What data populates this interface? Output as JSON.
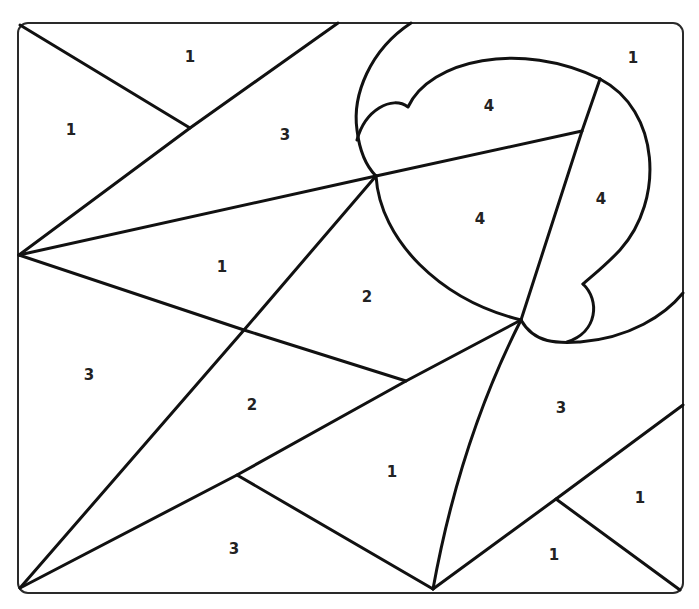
{
  "puzzle": {
    "type": "color-by-number",
    "colors": {
      "line": "#111111",
      "frame": "#2a2a2a",
      "background": "#ffffff"
    },
    "regions": [
      {
        "id": "r01",
        "number": "1",
        "x": 190,
        "y": 57
      },
      {
        "id": "r02",
        "number": "1",
        "x": 71,
        "y": 130
      },
      {
        "id": "r03",
        "number": "3",
        "x": 285,
        "y": 135
      },
      {
        "id": "r04",
        "number": "4",
        "x": 489,
        "y": 106
      },
      {
        "id": "r05",
        "number": "1",
        "x": 633,
        "y": 58
      },
      {
        "id": "r06",
        "number": "4",
        "x": 601,
        "y": 199
      },
      {
        "id": "r07",
        "number": "4",
        "x": 480,
        "y": 219
      },
      {
        "id": "r08",
        "number": "1",
        "x": 222,
        "y": 267
      },
      {
        "id": "r09",
        "number": "2",
        "x": 367,
        "y": 297
      },
      {
        "id": "r10",
        "number": "3",
        "x": 89,
        "y": 375
      },
      {
        "id": "r11",
        "number": "2",
        "x": 252,
        "y": 405
      },
      {
        "id": "r12",
        "number": "3",
        "x": 561,
        "y": 408
      },
      {
        "id": "r13",
        "number": "1",
        "x": 392,
        "y": 472
      },
      {
        "id": "r14",
        "number": "1",
        "x": 640,
        "y": 498
      },
      {
        "id": "r15",
        "number": "3",
        "x": 234,
        "y": 549
      },
      {
        "id": "r16",
        "number": "1",
        "x": 554,
        "y": 555
      }
    ]
  }
}
